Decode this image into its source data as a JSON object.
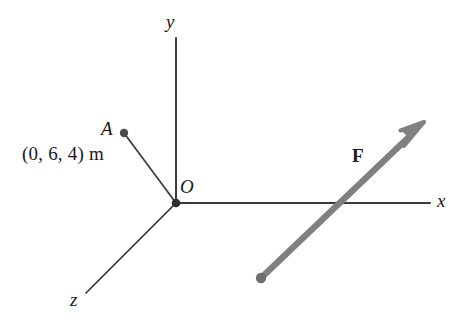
{
  "figure": {
    "background_color": "#ffffff",
    "axis_color": "#3a3a3a",
    "vector_color": "#808080",
    "label_color": "#1a1a1a",
    "width": 464,
    "height": 323
  },
  "origin": {
    "label": "O",
    "name": "origin-label",
    "x": 176,
    "y": 203
  },
  "axes": [
    {
      "id": "y",
      "label": "y",
      "x1": 176,
      "y1": 203,
      "x2": 176,
      "y2": 38,
      "label_x": 166,
      "label_y": 12
    },
    {
      "id": "x",
      "label": "x",
      "x1": 176,
      "y1": 203,
      "x2": 430,
      "y2": 203,
      "label_x": 437,
      "label_y": 191
    },
    {
      "id": "z",
      "label": "z",
      "x1": 176,
      "y1": 203,
      "x2": 86,
      "y2": 293,
      "label_x": 70,
      "label_y": 290
    }
  ],
  "points": [
    {
      "id": "A",
      "label": "A",
      "coordinate_text": "(0, 6, 4) m",
      "coordinates": [
        0,
        6,
        4
      ],
      "units": "m",
      "dot_x": 124,
      "dot_y": 133,
      "dot_radius": 4
    },
    {
      "id": "F_tail",
      "label": "",
      "dot_x": 261,
      "dot_y": 278,
      "dot_radius": 5
    }
  ],
  "segments": [
    {
      "id": "OA",
      "from": "O",
      "to": "A",
      "x1": 176,
      "y1": 203,
      "x2": 124,
      "y2": 133
    }
  ],
  "force": {
    "label": "F",
    "label_x": 352,
    "label_y": 146,
    "tail_x": 261,
    "tail_y": 278,
    "tip_x": 424,
    "tip_y": 122,
    "thickness": 6,
    "color": "#808080"
  }
}
